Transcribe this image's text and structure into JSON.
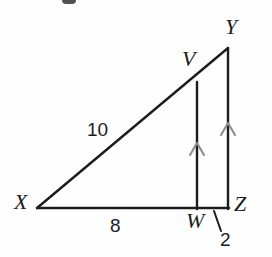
{
  "figure": {
    "kind": "geometry-diagram",
    "background_color": "#fefefe",
    "stroke_color": "#1c1c1c",
    "tick_color": "#888888",
    "vertices": [
      {
        "id": "Y",
        "label": "Y",
        "x": 228,
        "y": 48
      },
      {
        "id": "V",
        "label": "V",
        "x": 197,
        "y": 82
      },
      {
        "id": "X",
        "label": "X",
        "x": 37,
        "y": 208
      },
      {
        "id": "W",
        "label": "W",
        "x": 197,
        "y": 208
      },
      {
        "id": "Z",
        "label": "Z",
        "x": 228,
        "y": 208
      }
    ],
    "segments": [
      {
        "name": "hypotenuse-XY",
        "from": "X",
        "to": "Y"
      },
      {
        "name": "base-XZ",
        "from": "X",
        "to": "Z"
      },
      {
        "name": "leg-YZ",
        "from": "Y",
        "to": "Z"
      },
      {
        "name": "segment-VW",
        "from": "V",
        "to": "W"
      }
    ],
    "parallel_marks": [
      {
        "name": "arrow-mark-VW",
        "on": "segment-VW",
        "x": 197,
        "y": 147
      },
      {
        "name": "arrow-mark-YZ",
        "on": "leg-YZ",
        "x": 228,
        "y": 127
      }
    ],
    "measures": [
      {
        "name": "length-XV",
        "value": "10",
        "side": "XV"
      },
      {
        "name": "length-XW",
        "value": "8",
        "side": "XW"
      },
      {
        "name": "length-WZ",
        "value": "2",
        "side": "WZ",
        "has_leader_line": true
      }
    ],
    "leader_line": {
      "x1": 214,
      "y1": 211,
      "x2": 221,
      "y2": 231
    }
  }
}
